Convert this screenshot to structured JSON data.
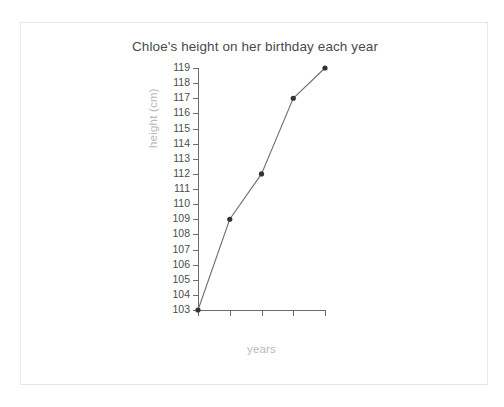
{
  "chart_data": {
    "type": "line",
    "title": "Chloe's height on her birthday each year",
    "xlabel": "years",
    "ylabel": "height (cm)",
    "categories": [
      "2013",
      "2014",
      "2015",
      "2016",
      "2017"
    ],
    "values": [
      103,
      109,
      112,
      117,
      119
    ],
    "ylim": [
      103,
      119
    ],
    "yticks": [
      103,
      104,
      105,
      106,
      107,
      108,
      109,
      110,
      111,
      112,
      113,
      114,
      115,
      116,
      117,
      118,
      119
    ],
    "grid": false,
    "legend": "none",
    "marker": "circle",
    "colors": {
      "line": "#6f6f73",
      "marker": "#333333",
      "axis": "#6b6b6b",
      "tick_label": "#4d4d4d",
      "axis_label": "#b9b9bd",
      "title": "#4a4a4a",
      "card_border": "#e8e8ea",
      "background": "#ffffff"
    }
  }
}
